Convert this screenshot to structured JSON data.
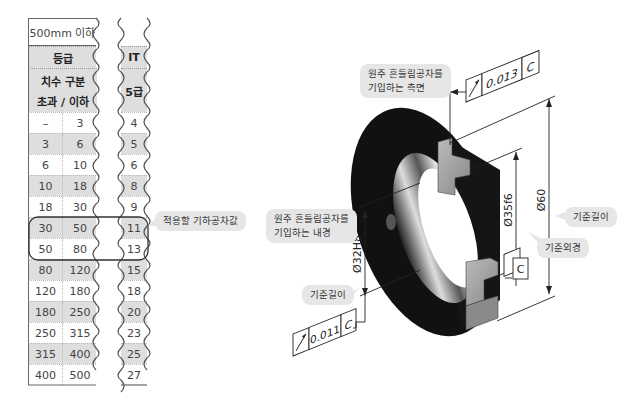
{
  "table": {
    "range_header": "500mm 이하",
    "grade_label": "등급",
    "size_label_line1": "치수 구분",
    "size_label_line2": "초과 / 이하",
    "it_label": "IT",
    "it_grade": "5급",
    "rows": [
      {
        "over": "–",
        "upto": "3",
        "it": "4",
        "shade": false
      },
      {
        "over": "3",
        "upto": "6",
        "it": "5",
        "shade": true
      },
      {
        "over": "6",
        "upto": "10",
        "it": "6",
        "shade": false
      },
      {
        "over": "10",
        "upto": "18",
        "it": "8",
        "shade": true
      },
      {
        "over": "18",
        "upto": "30",
        "it": "9",
        "shade": false
      },
      {
        "over": "30",
        "upto": "50",
        "it": "11",
        "shade": true
      },
      {
        "over": "50",
        "upto": "80",
        "it": "13",
        "shade": false
      },
      {
        "over": "80",
        "upto": "120",
        "it": "15",
        "shade": true
      },
      {
        "over": "120",
        "upto": "180",
        "it": "18",
        "shade": false
      },
      {
        "over": "180",
        "upto": "250",
        "it": "20",
        "shade": true
      },
      {
        "over": "250",
        "upto": "315",
        "it": "23",
        "shade": false
      },
      {
        "over": "315",
        "upto": "400",
        "it": "25",
        "shade": true
      },
      {
        "over": "400",
        "upto": "500",
        "it": "27",
        "shade": false
      }
    ],
    "highlight_rows": [
      5,
      6
    ]
  },
  "callouts": {
    "applied_tolerance": "적용할 기하공차값",
    "side_face_line1": "원주 흔들림공차를",
    "side_face_line2": "기입하는 측면",
    "inner_dia_line1": "원주 흔들림공차를",
    "inner_dia_line2": "기입하는 내경",
    "ref_length_right": "기준길이",
    "ref_outer_dia": "기준외경",
    "ref_length_left": "기준길이"
  },
  "drawing": {
    "fcf_top": {
      "symbol": "circular-runout",
      "value": "0.013",
      "datum": "C"
    },
    "fcf_bottom": {
      "symbol": "circular-runout",
      "value": "0.011",
      "datum": "C"
    },
    "datum_label": "C",
    "dim_outer": "Ø60",
    "dim_pilot": "Ø35f6",
    "dim_bore": "Ø32H8"
  }
}
